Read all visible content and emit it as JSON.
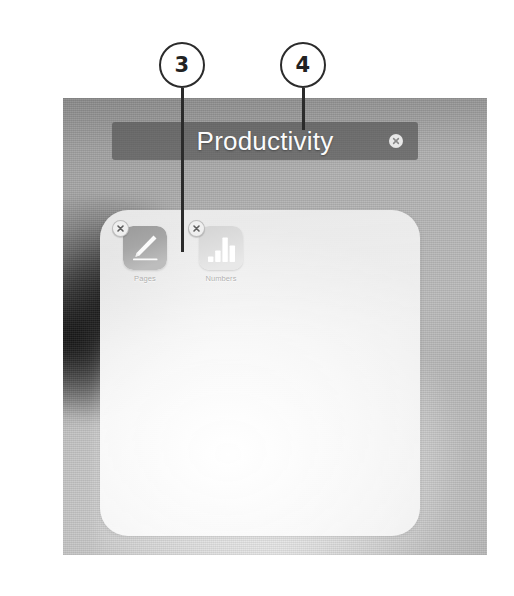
{
  "figure": {
    "callouts": [
      {
        "number": "3",
        "name": "callout-3",
        "cx": 182,
        "cy": 65,
        "line_top": 88,
        "line_height": 164
      },
      {
        "number": "4",
        "name": "callout-4",
        "cx": 303,
        "cy": 65,
        "line_top": 88,
        "line_height": 42
      }
    ]
  },
  "screen": {
    "folder": {
      "title": "Productivity",
      "title_placeholder": "Folder Name",
      "clear_icon": "clear-circle-x-icon",
      "apps": [
        {
          "label": "Pages",
          "icon": "pages-app-icon",
          "delete_badge_icon": "delete-x-badge-icon",
          "icon_bg_from": "#8e8e8e",
          "icon_bg_to": "#b4b4b4"
        },
        {
          "label": "Numbers",
          "icon": "numbers-app-icon",
          "delete_badge_icon": "delete-x-badge-icon",
          "icon_bg_from": "#cfcfcf",
          "icon_bg_to": "#e4e4e4",
          "bar_heights": [
            30,
            52,
            86,
            66
          ]
        }
      ]
    }
  },
  "colors": {
    "callout_stroke": "#2b2b2b",
    "title_bar_bg": "rgba(78,78,78,0.62)",
    "title_text": "#fbfbfb",
    "page_bg": "#ffffff"
  }
}
